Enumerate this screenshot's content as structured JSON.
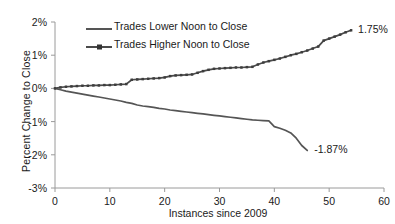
{
  "chart_data": {
    "type": "line",
    "title": "",
    "xlabel": "Instances since 2009",
    "ylabel": "Percent Change  to Close",
    "xlim": [
      0,
      60
    ],
    "ylim": [
      -3,
      2
    ],
    "xticks": [
      "0",
      "10",
      "20",
      "30",
      "40",
      "50",
      "60"
    ],
    "xtick_values": [
      0,
      10,
      20,
      30,
      40,
      50,
      60
    ],
    "yticks": [
      "2%",
      "1%",
      "0%",
      "-1%",
      "-2%",
      "-3%"
    ],
    "ytick_values": [
      2,
      1,
      0,
      -1,
      -2,
      -3
    ],
    "grid": false,
    "legend_position": "upper-center-left",
    "line_color": "#4d4d4d",
    "background": "#ffffff",
    "series": [
      {
        "name": "Trades Lower Noon to Close",
        "marker": "none",
        "x": [
          0,
          1,
          2,
          3,
          4,
          5,
          6,
          7,
          8,
          9,
          10,
          11,
          12,
          13,
          14,
          15,
          16,
          17,
          18,
          19,
          20,
          21,
          22,
          23,
          24,
          25,
          26,
          27,
          28,
          29,
          30,
          31,
          32,
          33,
          34,
          35,
          36,
          37,
          38,
          39,
          40,
          41,
          42,
          43,
          44,
          45,
          46
        ],
        "values": [
          0.0,
          -0.04,
          -0.08,
          -0.11,
          -0.14,
          -0.17,
          -0.2,
          -0.23,
          -0.26,
          -0.29,
          -0.32,
          -0.35,
          -0.38,
          -0.42,
          -0.45,
          -0.5,
          -0.53,
          -0.55,
          -0.57,
          -0.6,
          -0.62,
          -0.65,
          -0.67,
          -0.69,
          -0.71,
          -0.73,
          -0.75,
          -0.77,
          -0.79,
          -0.81,
          -0.83,
          -0.85,
          -0.87,
          -0.89,
          -0.91,
          -0.93,
          -0.95,
          -0.96,
          -0.97,
          -0.98,
          -1.15,
          -1.2,
          -1.26,
          -1.34,
          -1.5,
          -1.72,
          -1.87
        ],
        "end_label": "-1.87%"
      },
      {
        "name": "Trades Higher Noon to Close",
        "marker": "dot",
        "x": [
          0,
          1,
          2,
          3,
          4,
          5,
          6,
          7,
          8,
          9,
          10,
          11,
          12,
          13,
          14,
          15,
          16,
          17,
          18,
          19,
          20,
          21,
          22,
          23,
          24,
          25,
          26,
          27,
          28,
          29,
          30,
          31,
          32,
          33,
          34,
          35,
          36,
          37,
          38,
          39,
          40,
          41,
          42,
          43,
          44,
          45,
          46,
          47,
          48,
          49,
          50,
          51,
          52,
          53,
          54
        ],
        "values": [
          0.0,
          0.03,
          0.05,
          0.06,
          0.07,
          0.08,
          0.08,
          0.09,
          0.09,
          0.1,
          0.1,
          0.11,
          0.12,
          0.13,
          0.26,
          0.27,
          0.28,
          0.29,
          0.3,
          0.31,
          0.33,
          0.37,
          0.39,
          0.4,
          0.41,
          0.42,
          0.47,
          0.52,
          0.56,
          0.59,
          0.6,
          0.61,
          0.62,
          0.63,
          0.63,
          0.64,
          0.65,
          0.72,
          0.78,
          0.82,
          0.86,
          0.9,
          0.95,
          1.0,
          1.04,
          1.09,
          1.14,
          1.2,
          1.26,
          1.44,
          1.5,
          1.56,
          1.62,
          1.69,
          1.75
        ],
        "end_label": "1.75%"
      }
    ],
    "annotations": [
      {
        "text": "1.75%",
        "x": 54,
        "y": 1.75,
        "position": "right"
      },
      {
        "text": "-1.87%",
        "x": 46,
        "y": -1.87,
        "position": "right"
      }
    ]
  },
  "legend": {
    "items": [
      {
        "label": "Trades Lower Noon to Close"
      },
      {
        "label": "Trades Higher Noon to Close"
      }
    ]
  },
  "axes": {
    "x_title": "Instances since 2009",
    "y_title": "Percent Change  to Close",
    "x_ticks": [
      "0",
      "10",
      "20",
      "30",
      "40",
      "50",
      "60"
    ],
    "y_ticks": [
      "2%",
      "1%",
      "0%",
      "-1%",
      "-2%",
      "-3%"
    ]
  },
  "labels": {
    "upper_end": "1.75%",
    "lower_end": "-1.87%"
  }
}
